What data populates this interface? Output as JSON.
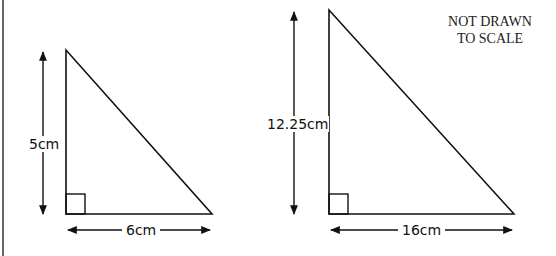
{
  "diagram": {
    "title_note": [
      "NOT DRAWN",
      "TO SCALE"
    ],
    "colors": {
      "stroke": "#111111",
      "background": "#ffffff"
    },
    "triangles": [
      {
        "name": "small-triangle",
        "height_label": "5cm",
        "base_label": "6cm",
        "height_value_cm": 5,
        "base_value_cm": 6,
        "right_angle": true
      },
      {
        "name": "large-triangle",
        "height_label": "12.25cm",
        "base_label": "16cm",
        "height_value_cm": 12.25,
        "base_value_cm": 16,
        "right_angle": true
      }
    ]
  }
}
